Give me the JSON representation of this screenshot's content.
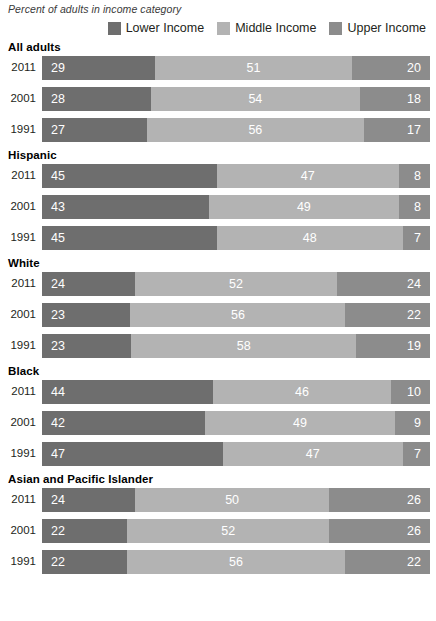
{
  "subtitle": "Percent of adults in income category",
  "colors": {
    "lower": "#6e6e6e",
    "middle": "#b3b3b3",
    "upper": "#8c8c8c",
    "background": "#ffffff",
    "text": "#231f20",
    "value_text": "#ffffff"
  },
  "legend": {
    "items": [
      {
        "label": "Lower Income",
        "color": "#6e6e6e",
        "key": "lower"
      },
      {
        "label": "Middle Income",
        "color": "#b3b3b3",
        "key": "middle"
      },
      {
        "label": "Upper Income",
        "color": "#8c8c8c",
        "key": "upper"
      }
    ]
  },
  "chart_data": {
    "type": "bar",
    "subtype": "stacked-horizontal-100pct",
    "title": "",
    "subtitle": "Percent of adults in income category",
    "xlabel": "",
    "ylabel": "",
    "xlim": [
      0,
      100
    ],
    "grid": false,
    "legend_position": "top-right",
    "series": [
      {
        "name": "Lower Income",
        "color": "#6e6e6e"
      },
      {
        "name": "Middle Income",
        "color": "#b3b3b3"
      },
      {
        "name": "Upper Income",
        "color": "#8c8c8c"
      }
    ],
    "groups": [
      {
        "name": "All adults",
        "rows": [
          {
            "year": "2011",
            "lower": 29,
            "middle": 51,
            "upper": 20
          },
          {
            "year": "2001",
            "lower": 28,
            "middle": 54,
            "upper": 18
          },
          {
            "year": "1991",
            "lower": 27,
            "middle": 56,
            "upper": 17
          }
        ]
      },
      {
        "name": "Hispanic",
        "rows": [
          {
            "year": "2011",
            "lower": 45,
            "middle": 47,
            "upper": 8
          },
          {
            "year": "2001",
            "lower": 43,
            "middle": 49,
            "upper": 8
          },
          {
            "year": "1991",
            "lower": 45,
            "middle": 48,
            "upper": 7
          }
        ]
      },
      {
        "name": "White",
        "rows": [
          {
            "year": "2011",
            "lower": 24,
            "middle": 52,
            "upper": 24
          },
          {
            "year": "2001",
            "lower": 23,
            "middle": 56,
            "upper": 22
          },
          {
            "year": "1991",
            "lower": 23,
            "middle": 58,
            "upper": 19
          }
        ]
      },
      {
        "name": "Black",
        "rows": [
          {
            "year": "2011",
            "lower": 44,
            "middle": 46,
            "upper": 10
          },
          {
            "year": "2001",
            "lower": 42,
            "middle": 49,
            "upper": 9
          },
          {
            "year": "1991",
            "lower": 47,
            "middle": 47,
            "upper": 7
          }
        ]
      },
      {
        "name": "Asian and Pacific Islander",
        "rows": [
          {
            "year": "2011",
            "lower": 24,
            "middle": 50,
            "upper": 26
          },
          {
            "year": "2001",
            "lower": 22,
            "middle": 52,
            "upper": 26
          },
          {
            "year": "1991",
            "lower": 22,
            "middle": 56,
            "upper": 22
          }
        ]
      }
    ]
  }
}
